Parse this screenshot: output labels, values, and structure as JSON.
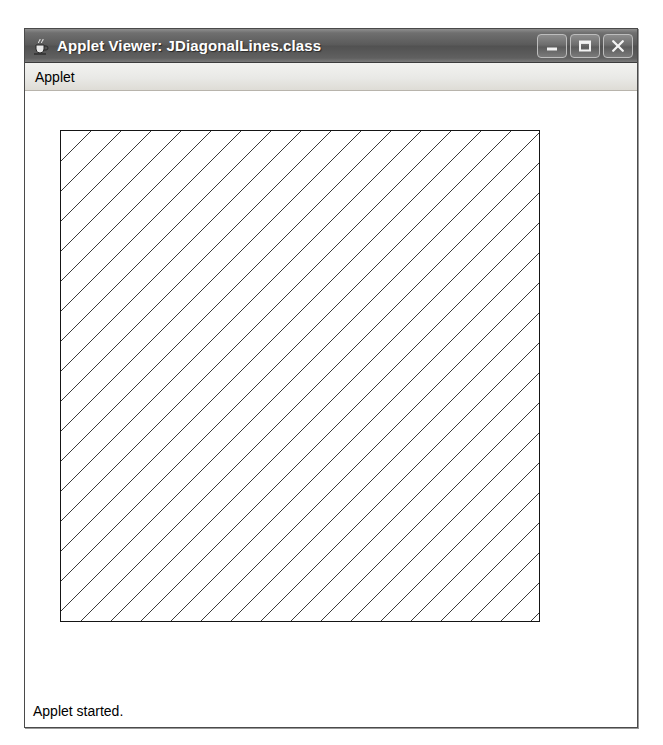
{
  "window": {
    "title": "Applet Viewer: JDiagonalLines.class",
    "icon": "java-coffee-cup-icon",
    "frame_color": "#d4d0c8",
    "titlebar_color": "#5a5a5a",
    "titlebar_text_color": "#ffffff",
    "controls": [
      {
        "name": "minimize",
        "label": "_",
        "glyph": "minimize-icon"
      },
      {
        "name": "maximize",
        "label": "□",
        "glyph": "maximize-icon"
      },
      {
        "name": "close",
        "label": "×",
        "glyph": "close-icon"
      }
    ]
  },
  "menu": {
    "items": [
      {
        "label": "Applet"
      }
    ]
  },
  "canvas": {
    "background": "#ffffff",
    "shape": {
      "name": "diagonal-hatch-square",
      "outline_color": "#151515",
      "line_color": "#3a3a3a",
      "x": 60,
      "y": 140,
      "width": 480,
      "height": 492,
      "line_count": 33,
      "line_spacing_px": 30,
      "line_direction": "lower-left-to-upper-right",
      "line_angle_deg": 45,
      "line_width_px": 1
    }
  },
  "status": {
    "text": "Applet started."
  }
}
